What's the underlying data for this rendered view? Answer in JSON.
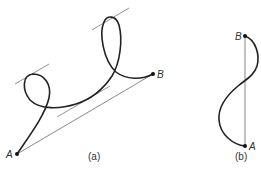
{
  "figure_a": {
    "caption": "(a)",
    "point_start": "A",
    "point_end": "B",
    "description": "Curve from A to B with two loops; chord AB and three tangent lines parallel to chord"
  },
  "figure_b": {
    "caption": "(b)",
    "point_start": "A",
    "point_end": "B",
    "description": "S-shaped curve from A to B with vertical chord AB"
  },
  "colors": {
    "curve": "#222222",
    "chord": "#555555",
    "tangent": "#666666",
    "background": "#ffffff"
  }
}
